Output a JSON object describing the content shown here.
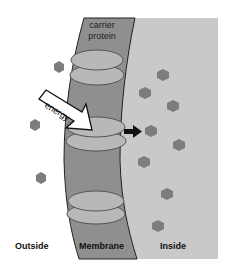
{
  "diagram": {
    "labels": {
      "carrier_protein_line1": "carrier",
      "carrier_protein_line2": "protein",
      "energy": "energy",
      "outside": "Outside",
      "membrane": "Membrane",
      "inside": "Inside"
    },
    "regions": [
      "Outside",
      "Membrane",
      "Inside"
    ],
    "molecules": {
      "outside_count": 3,
      "inside_count": 8
    },
    "colors": {
      "background": "#ffffff",
      "inside_region": "#c9c9c9",
      "membrane": "#8f8f8f",
      "carrier_protein": "#b8b8b8",
      "molecule": "#7d7d7d",
      "arrow": "#111111"
    }
  }
}
